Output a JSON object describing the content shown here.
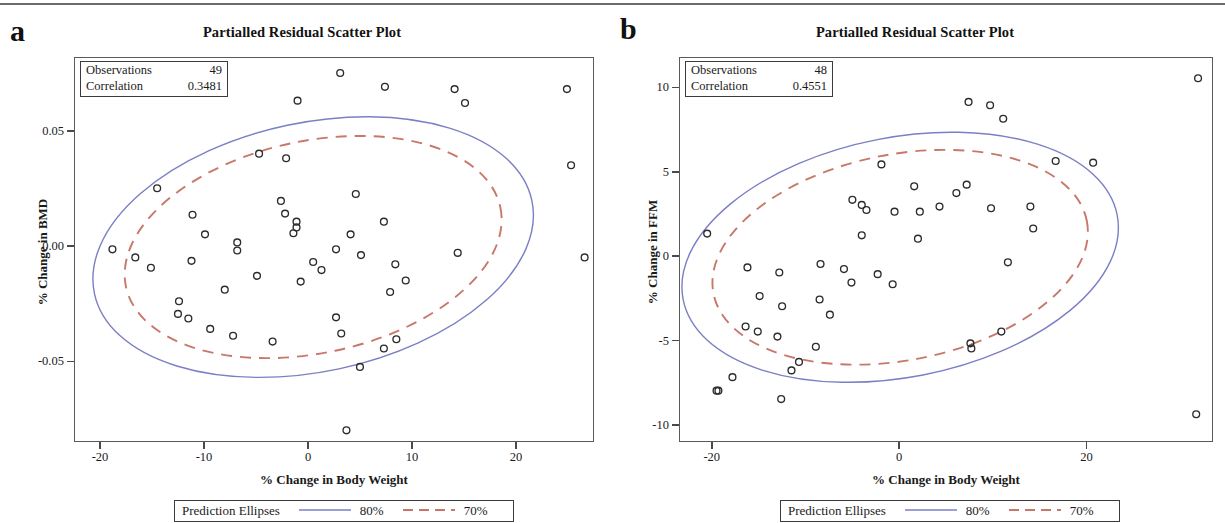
{
  "figure": {
    "panels": [
      {
        "letter": "a",
        "title": "Partialled Residual Scatter Plot",
        "stats": {
          "observations_label": "Observations",
          "observations_value": "49",
          "correlation_label": "Correlation",
          "correlation_value": "0.3481"
        },
        "xlabel": "% Change in Body Weight",
        "ylabel": "% Change in BMD",
        "xticks": [
          "-20",
          "-10",
          "0",
          "10",
          "20"
        ],
        "yticks": [
          "0.05",
          "0.00",
          "-0.05"
        ],
        "legend": {
          "title": "Prediction Ellipses",
          "series": [
            {
              "label": "80%",
              "style": "solid",
              "color": "#7b7fc4"
            },
            {
              "label": "70%",
              "style": "dashed",
              "color": "#c8786a"
            }
          ]
        }
      },
      {
        "letter": "b",
        "title": "Partialled Residual Scatter Plot",
        "stats": {
          "observations_label": "Observations",
          "observations_value": "48",
          "correlation_label": "Correlation",
          "correlation_value": "0.4551"
        },
        "xlabel": "% Change in Body Weight",
        "ylabel": "% Change in FFM",
        "xticks": [
          "-20",
          "0",
          "20"
        ],
        "yticks": [
          "10",
          "5",
          "0",
          "-5",
          "-10"
        ],
        "legend": {
          "title": "Prediction Ellipses",
          "series": [
            {
              "label": "80%",
              "style": "solid",
              "color": "#7b7fc4"
            },
            {
              "label": "70%",
              "style": "dashed",
              "color": "#c8786a"
            }
          ]
        }
      }
    ]
  },
  "chart_data": [
    {
      "type": "scatter",
      "panel": "a",
      "title": "Partialled Residual Scatter Plot",
      "xlabel": "% Change in Body Weight",
      "ylabel": "% Change in BMD",
      "xlim": [
        -22.5,
        27.5
      ],
      "ylim": [
        -0.085,
        0.082
      ],
      "xticks": [
        -20,
        -10,
        0,
        10,
        20
      ],
      "yticks": [
        0.05,
        0.0,
        -0.05
      ],
      "grid": false,
      "observations": 49,
      "correlation": 0.3481,
      "marker": "open-circle",
      "points": [
        [
          3.0,
          0.0755
        ],
        [
          7.3,
          0.0695
        ],
        [
          14.0,
          0.0685
        ],
        [
          24.8,
          0.0685
        ],
        [
          -1.1,
          0.0635
        ],
        [
          15.0,
          0.0625
        ],
        [
          25.2,
          0.0355
        ],
        [
          -14.6,
          0.0255
        ],
        [
          -4.8,
          0.0405
        ],
        [
          -2.2,
          0.0385
        ],
        [
          -11.2,
          0.014
        ],
        [
          -10.0,
          0.0055
        ],
        [
          -6.9,
          0.002
        ],
        [
          -6.9,
          -0.0015
        ],
        [
          -2.3,
          0.0145
        ],
        [
          -1.5,
          0.006
        ],
        [
          -1.2,
          0.011
        ],
        [
          -1.2,
          0.0085
        ],
        [
          -2.7,
          0.02
        ],
        [
          4.5,
          0.023
        ],
        [
          4.0,
          0.0055
        ],
        [
          7.2,
          0.011
        ],
        [
          2.6,
          -0.001
        ],
        [
          5.0,
          -0.0035
        ],
        [
          -18.9,
          -0.001
        ],
        [
          -16.7,
          -0.0045
        ],
        [
          -15.2,
          -0.009
        ],
        [
          -11.3,
          -0.006
        ],
        [
          -12.5,
          -0.0235
        ],
        [
          -12.6,
          -0.029
        ],
        [
          -11.6,
          -0.031
        ],
        [
          -9.5,
          -0.0355
        ],
        [
          -7.3,
          -0.0385
        ],
        [
          -8.1,
          -0.0185
        ],
        [
          -5.0,
          -0.0125
        ],
        [
          -0.8,
          -0.015
        ],
        [
          0.4,
          -0.0065
        ],
        [
          1.2,
          -0.01
        ],
        [
          -3.5,
          -0.041
        ],
        [
          2.6,
          -0.0305
        ],
        [
          3.1,
          -0.0375
        ],
        [
          8.3,
          -0.0075
        ],
        [
          9.3,
          -0.0145
        ],
        [
          7.8,
          -0.0195
        ],
        [
          8.4,
          -0.04
        ],
        [
          7.2,
          -0.044
        ],
        [
          14.3,
          -0.0025
        ],
        [
          4.9,
          -0.052
        ],
        [
          3.6,
          -0.0795
        ],
        [
          26.5,
          -0.0045
        ]
      ],
      "ellipses": [
        {
          "label": "80%",
          "style": "solid",
          "color": "#7b7fc4",
          "center": [
            0.4,
            0.0
          ],
          "semi_major": 21.5,
          "semi_minor": 0.054,
          "angle_deg": -12
        },
        {
          "label": "70%",
          "style": "dashed",
          "color": "#c8786a",
          "center": [
            0.4,
            0.0
          ],
          "semi_major": 18.4,
          "semi_minor": 0.046,
          "angle_deg": -12
        }
      ]
    },
    {
      "type": "scatter",
      "panel": "b",
      "title": "Partialled Residual Scatter Plot",
      "xlabel": "% Change in Body Weight",
      "ylabel": "% Change in FFM",
      "xlim": [
        -23.5,
        33.5
      ],
      "ylim": [
        -11.0,
        11.8
      ],
      "xticks": [
        -20,
        0,
        20
      ],
      "yticks": [
        10,
        5,
        0,
        -5,
        -10
      ],
      "grid": false,
      "observations": 48,
      "correlation": 0.4551,
      "marker": "open-circle",
      "points": [
        [
          31.8,
          10.6
        ],
        [
          7.3,
          9.2
        ],
        [
          9.6,
          9.0
        ],
        [
          11.0,
          8.2
        ],
        [
          16.6,
          5.7
        ],
        [
          20.6,
          5.6
        ],
        [
          -2.0,
          5.5
        ],
        [
          1.5,
          4.2
        ],
        [
          7.1,
          4.3
        ],
        [
          6.0,
          3.8
        ],
        [
          -5.1,
          3.4
        ],
        [
          -4.1,
          3.1
        ],
        [
          -3.6,
          2.8
        ],
        [
          4.2,
          3.0
        ],
        [
          -0.6,
          2.7
        ],
        [
          2.1,
          2.7
        ],
        [
          9.7,
          2.9
        ],
        [
          13.9,
          3.0
        ],
        [
          -4.1,
          1.3
        ],
        [
          1.9,
          1.1
        ],
        [
          14.2,
          1.7
        ],
        [
          -20.6,
          1.4
        ],
        [
          -16.3,
          -0.6
        ],
        [
          -12.9,
          -0.9
        ],
        [
          -8.5,
          -0.4
        ],
        [
          -6.0,
          -0.7
        ],
        [
          -2.4,
          -1.0
        ],
        [
          -0.8,
          -1.6
        ],
        [
          -5.2,
          -1.5
        ],
        [
          11.5,
          -0.3
        ],
        [
          -15.0,
          -2.3
        ],
        [
          -12.6,
          -2.9
        ],
        [
          -8.6,
          -2.5
        ],
        [
          -7.5,
          -3.4
        ],
        [
          -16.5,
          -4.1
        ],
        [
          -15.2,
          -4.4
        ],
        [
          -13.1,
          -4.7
        ],
        [
          -9.0,
          -5.3
        ],
        [
          -10.8,
          -6.2
        ],
        [
          -11.6,
          -6.7
        ],
        [
          7.5,
          -5.1
        ],
        [
          7.6,
          -5.4
        ],
        [
          10.8,
          -4.4
        ],
        [
          -17.9,
          -7.1
        ],
        [
          -19.4,
          -7.9
        ],
        [
          -12.7,
          -8.4
        ],
        [
          31.6,
          -9.3
        ],
        [
          -19.6,
          -7.9
        ]
      ],
      "ellipses": [
        {
          "label": "80%",
          "style": "solid",
          "color": "#7b7fc4",
          "center": [
            0.0,
            0.0
          ],
          "semi_major": 23.6,
          "semi_minor": 7.1,
          "angle_deg": -11
        },
        {
          "label": "70%",
          "style": "dashed",
          "color": "#c8786a",
          "center": [
            0.0,
            0.0
          ],
          "semi_major": 20.3,
          "semi_minor": 6.1,
          "angle_deg": -11
        }
      ]
    }
  ]
}
